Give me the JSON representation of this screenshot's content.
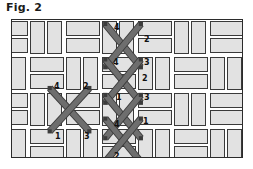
{
  "figure": {
    "caption": "Fig. 2",
    "colors": {
      "brick_fill": "#e2e2e2",
      "brick_outline": "#3a3a3a",
      "frame_outline": "#2b2b2b",
      "stitch_thread": "#6e6e6e",
      "stitch_thread_outline": "#3c3c3c",
      "label_text": "#111111",
      "background": "#ffffff"
    }
  },
  "diagram": {
    "type": "basketweave-brick-pattern-with-cross-stitch",
    "frame": {
      "x": 11,
      "y": 19,
      "width": 232,
      "height": 139
    },
    "weave": {
      "pattern": "basketweave",
      "unit": 36,
      "brick_thickness": 16,
      "gap": 2
    },
    "bricks": [
      {
        "x": -18,
        "y": 1,
        "w": 34,
        "h": 15,
        "orient": "horizontal"
      },
      {
        "x": -18,
        "y": 18,
        "w": 34,
        "h": 15,
        "orient": "horizontal"
      },
      {
        "x": 18,
        "y": 1,
        "w": 15,
        "h": 33,
        "orient": "vertical"
      },
      {
        "x": 35,
        "y": 1,
        "w": 15,
        "h": 33,
        "orient": "vertical"
      },
      {
        "x": 54,
        "y": 1,
        "w": 34,
        "h": 15,
        "orient": "horizontal"
      },
      {
        "x": 54,
        "y": 18,
        "w": 34,
        "h": 15,
        "orient": "horizontal"
      },
      {
        "x": 90,
        "y": 1,
        "w": 15,
        "h": 33,
        "orient": "vertical"
      },
      {
        "x": 107,
        "y": 1,
        "w": 15,
        "h": 33,
        "orient": "vertical"
      },
      {
        "x": 126,
        "y": 1,
        "w": 34,
        "h": 15,
        "orient": "horizontal"
      },
      {
        "x": 126,
        "y": 18,
        "w": 34,
        "h": 15,
        "orient": "horizontal"
      },
      {
        "x": 162,
        "y": 1,
        "w": 15,
        "h": 33,
        "orient": "vertical"
      },
      {
        "x": 179,
        "y": 1,
        "w": 15,
        "h": 33,
        "orient": "vertical"
      },
      {
        "x": 198,
        "y": 1,
        "w": 34,
        "h": 15,
        "orient": "horizontal"
      },
      {
        "x": 198,
        "y": 18,
        "w": 34,
        "h": 15,
        "orient": "horizontal"
      },
      {
        "x": -18,
        "y": 37,
        "w": 15,
        "h": 33,
        "orient": "vertical"
      },
      {
        "x": -1,
        "y": 37,
        "w": 15,
        "h": 33,
        "orient": "vertical"
      },
      {
        "x": 18,
        "y": 37,
        "w": 34,
        "h": 15,
        "orient": "horizontal"
      },
      {
        "x": 18,
        "y": 54,
        "w": 34,
        "h": 15,
        "orient": "horizontal"
      },
      {
        "x": 54,
        "y": 37,
        "w": 15,
        "h": 33,
        "orient": "vertical"
      },
      {
        "x": 71,
        "y": 37,
        "w": 15,
        "h": 33,
        "orient": "vertical"
      },
      {
        "x": 90,
        "y": 37,
        "w": 34,
        "h": 15,
        "orient": "horizontal"
      },
      {
        "x": 90,
        "y": 54,
        "w": 34,
        "h": 15,
        "orient": "horizontal"
      },
      {
        "x": 126,
        "y": 37,
        "w": 15,
        "h": 33,
        "orient": "vertical"
      },
      {
        "x": 143,
        "y": 37,
        "w": 15,
        "h": 33,
        "orient": "vertical"
      },
      {
        "x": 162,
        "y": 37,
        "w": 34,
        "h": 15,
        "orient": "horizontal"
      },
      {
        "x": 162,
        "y": 54,
        "w": 34,
        "h": 15,
        "orient": "horizontal"
      },
      {
        "x": 198,
        "y": 37,
        "w": 15,
        "h": 33,
        "orient": "vertical"
      },
      {
        "x": 215,
        "y": 37,
        "w": 15,
        "h": 33,
        "orient": "vertical"
      },
      {
        "x": -18,
        "y": 73,
        "w": 34,
        "h": 15,
        "orient": "horizontal"
      },
      {
        "x": -18,
        "y": 90,
        "w": 34,
        "h": 15,
        "orient": "horizontal"
      },
      {
        "x": 18,
        "y": 73,
        "w": 15,
        "h": 33,
        "orient": "vertical"
      },
      {
        "x": 35,
        "y": 73,
        "w": 15,
        "h": 33,
        "orient": "vertical"
      },
      {
        "x": 54,
        "y": 73,
        "w": 34,
        "h": 15,
        "orient": "horizontal"
      },
      {
        "x": 54,
        "y": 90,
        "w": 34,
        "h": 15,
        "orient": "horizontal"
      },
      {
        "x": 90,
        "y": 73,
        "w": 15,
        "h": 33,
        "orient": "vertical"
      },
      {
        "x": 107,
        "y": 73,
        "w": 15,
        "h": 33,
        "orient": "vertical"
      },
      {
        "x": 126,
        "y": 73,
        "w": 34,
        "h": 15,
        "orient": "horizontal"
      },
      {
        "x": 126,
        "y": 90,
        "w": 34,
        "h": 15,
        "orient": "horizontal"
      },
      {
        "x": 162,
        "y": 73,
        "w": 15,
        "h": 33,
        "orient": "vertical"
      },
      {
        "x": 179,
        "y": 73,
        "w": 15,
        "h": 33,
        "orient": "vertical"
      },
      {
        "x": 198,
        "y": 73,
        "w": 34,
        "h": 15,
        "orient": "horizontal"
      },
      {
        "x": 198,
        "y": 90,
        "w": 34,
        "h": 15,
        "orient": "horizontal"
      },
      {
        "x": -18,
        "y": 109,
        "w": 15,
        "h": 33,
        "orient": "vertical"
      },
      {
        "x": -1,
        "y": 109,
        "w": 15,
        "h": 33,
        "orient": "vertical"
      },
      {
        "x": 18,
        "y": 109,
        "w": 34,
        "h": 15,
        "orient": "horizontal"
      },
      {
        "x": 18,
        "y": 126,
        "w": 34,
        "h": 15,
        "orient": "horizontal"
      },
      {
        "x": 54,
        "y": 109,
        "w": 15,
        "h": 33,
        "orient": "vertical"
      },
      {
        "x": 71,
        "y": 109,
        "w": 15,
        "h": 33,
        "orient": "vertical"
      },
      {
        "x": 90,
        "y": 109,
        "w": 34,
        "h": 15,
        "orient": "horizontal"
      },
      {
        "x": 90,
        "y": 126,
        "w": 34,
        "h": 15,
        "orient": "horizontal"
      },
      {
        "x": 126,
        "y": 109,
        "w": 15,
        "h": 33,
        "orient": "vertical"
      },
      {
        "x": 143,
        "y": 109,
        "w": 15,
        "h": 33,
        "orient": "vertical"
      },
      {
        "x": 162,
        "y": 109,
        "w": 34,
        "h": 15,
        "orient": "horizontal"
      },
      {
        "x": 162,
        "y": 126,
        "w": 34,
        "h": 15,
        "orient": "horizontal"
      },
      {
        "x": 198,
        "y": 109,
        "w": 15,
        "h": 33,
        "orient": "vertical"
      },
      {
        "x": 215,
        "y": 109,
        "w": 15,
        "h": 33,
        "orient": "vertical"
      }
    ],
    "stitches": [
      {
        "id": "cross-col-1",
        "cx": 112,
        "cy": 26,
        "hw": 18,
        "hh": 22
      },
      {
        "id": "cross-col-2",
        "cx": 112,
        "cy": 62,
        "hw": 18,
        "hh": 22
      },
      {
        "id": "cross-col-3",
        "cx": 112,
        "cy": 98,
        "hw": 18,
        "hh": 22
      },
      {
        "id": "cross-col-4",
        "cx": 112,
        "cy": 122,
        "hw": 18,
        "hh": 22
      },
      {
        "id": "cross-left",
        "cx": 58,
        "cy": 91,
        "hw": 20,
        "hh": 22
      }
    ],
    "stitch_labels": [
      {
        "id": "label-top-4",
        "text": "4",
        "x": 102,
        "y": 4
      },
      {
        "id": "label-top-2",
        "text": "2",
        "x": 132,
        "y": 16
      },
      {
        "id": "label-mid-4",
        "text": "4",
        "x": 101,
        "y": 39
      },
      {
        "id": "label-mid-3",
        "text": "3",
        "x": 132,
        "y": 39
      },
      {
        "id": "label-mid-2",
        "text": "2",
        "x": 130,
        "y": 55
      },
      {
        "id": "label-low-1",
        "text": "1",
        "x": 104,
        "y": 74
      },
      {
        "id": "label-low-3",
        "text": "3",
        "x": 132,
        "y": 74
      },
      {
        "id": "label-bot-4",
        "text": "4",
        "x": 102,
        "y": 101
      },
      {
        "id": "label-bot-1",
        "text": "1",
        "x": 131,
        "y": 98
      },
      {
        "id": "label-bot-2",
        "text": "2",
        "x": 102,
        "y": 133
      },
      {
        "id": "label-left-4",
        "text": "4",
        "x": 42,
        "y": 63
      },
      {
        "id": "label-left-2",
        "text": "2",
        "x": 71,
        "y": 63
      },
      {
        "id": "label-left-1",
        "text": "1",
        "x": 43,
        "y": 113
      },
      {
        "id": "label-left-3",
        "text": "3",
        "x": 72,
        "y": 113
      }
    ]
  }
}
